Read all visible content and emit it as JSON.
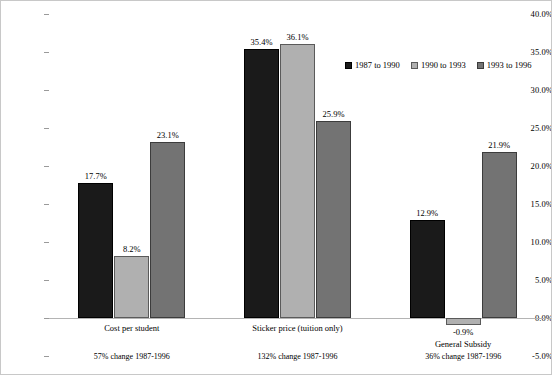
{
  "chart_data": {
    "type": "bar",
    "title": "",
    "xlabel": "",
    "ylabel": "",
    "ylim": [
      -5,
      40
    ],
    "ytick_labels": [
      "40.0%",
      "35.0%",
      "30.0%",
      "25.0%",
      "20.0%",
      "15.0%",
      "10.0%",
      "5.0%",
      "0.0%",
      "-5.0%"
    ],
    "ytick_values": [
      40,
      35,
      30,
      25,
      20,
      15,
      10,
      5,
      0,
      -5
    ],
    "grid": false,
    "legend_position": "upper-right-inside",
    "categories": [
      "Cost per student",
      "Sticker price (tuition only)",
      "General Subsidy"
    ],
    "category_sublabels": [
      "57% change 1987-1996",
      "132% change 1987-1996",
      "36% change 1987-1996"
    ],
    "series": [
      {
        "name": "1987 to 1990",
        "color": "#1a1a1a",
        "values": [
          17.7,
          35.4,
          12.9
        ],
        "labels": [
          "17.7%",
          "35.4%",
          "12.9%"
        ]
      },
      {
        "name": "1990 to 1993",
        "color": "#b0b0b0",
        "values": [
          8.2,
          36.1,
          -0.9
        ],
        "labels": [
          "8.2%",
          "36.1%",
          "-0.9%"
        ]
      },
      {
        "name": "1993 to 1996",
        "color": "#737373",
        "values": [
          23.1,
          25.9,
          21.9
        ],
        "labels": [
          "23.1%",
          "25.9%",
          "21.9%"
        ]
      }
    ]
  },
  "legend": {
    "entries": [
      {
        "label": "1987 to 1990"
      },
      {
        "label": "1990 to 1993"
      },
      {
        "label": "1993 to 1996"
      }
    ]
  },
  "axis": {
    "ticks": [
      {
        "label": "40.0%"
      },
      {
        "label": "35.0%"
      },
      {
        "label": "30.0%"
      },
      {
        "label": "25.0%"
      },
      {
        "label": "20.0%"
      },
      {
        "label": "15.0%"
      },
      {
        "label": "10.0%"
      },
      {
        "label": "5.0%"
      },
      {
        "label": "0.0%"
      },
      {
        "label": "-5.0%"
      }
    ]
  }
}
